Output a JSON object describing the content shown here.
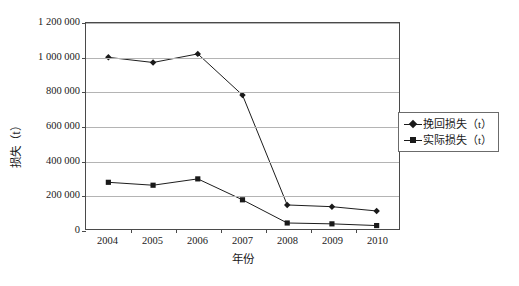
{
  "chart_data": {
    "type": "line",
    "title": "",
    "xlabel": "年份",
    "ylabel": "损失（t）",
    "categories": [
      "2004",
      "2005",
      "2006",
      "2007",
      "2008",
      "2009",
      "2010"
    ],
    "ylim": [
      0,
      1200000
    ],
    "yticks": [
      0,
      200000,
      400000,
      600000,
      800000,
      1000000,
      1200000
    ],
    "ytick_labels": [
      "0",
      "200 000",
      "400 000",
      "600 000",
      "800 000",
      "1 000 000",
      "1 200 000"
    ],
    "grid": true,
    "legend_position": "right",
    "series": [
      {
        "name": "挽回损失（t）",
        "marker": "diamond",
        "color": "#1a1a1a",
        "values": [
          1000000,
          970000,
          1020000,
          780000,
          140000,
          130000,
          105000
        ]
      },
      {
        "name": "实际损失（t）",
        "marker": "square",
        "color": "#1a1a1a",
        "values": [
          272000,
          255000,
          292000,
          170000,
          35000,
          30000,
          20000
        ]
      }
    ]
  },
  "legend": {
    "items": [
      {
        "label": "挽回损失（t）",
        "marker": "diamond"
      },
      {
        "label": "实际损失（t）",
        "marker": "square"
      }
    ]
  },
  "axes": {
    "y_title": "损失（t）",
    "x_title": "年份"
  }
}
